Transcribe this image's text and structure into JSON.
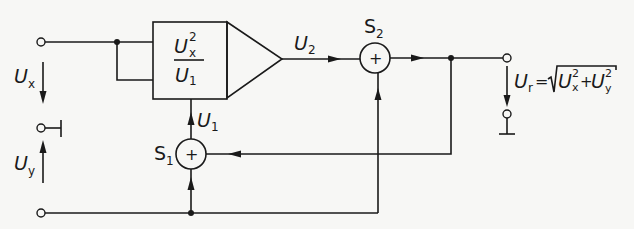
{
  "diagram": {
    "colors": {
      "line": "#1a1a1a",
      "background": "#f7f7f5"
    },
    "inputs": [
      {
        "id": "ux",
        "symbol": "U",
        "subscript": "x"
      },
      {
        "id": "uy",
        "symbol": "U",
        "subscript": "y"
      }
    ],
    "blocks": {
      "divider": {
        "numerator_symbol": "U",
        "numerator_subscript": "x",
        "numerator_superscript": "2",
        "denominator_symbol": "U",
        "denominator_subscript": "1"
      },
      "amplifier": {
        "type": "triangle"
      }
    },
    "summers": [
      {
        "id": "s1",
        "label": "S",
        "label_subscript": "1",
        "sign": "+"
      },
      {
        "id": "s2",
        "label": "S",
        "label_subscript": "2",
        "sign": "+"
      }
    ],
    "signals": {
      "u1": {
        "symbol": "U",
        "subscript": "1"
      },
      "u2": {
        "symbol": "U",
        "subscript": "2"
      }
    },
    "output": {
      "symbol": "U",
      "subscript": "r",
      "equals": "=",
      "radical": "√",
      "term1_symbol": "U",
      "term1_subscript": "x",
      "term1_superscript": "2",
      "plus": "+",
      "term2_symbol": "U",
      "term2_subscript": "y",
      "term2_superscript": "2"
    }
  }
}
